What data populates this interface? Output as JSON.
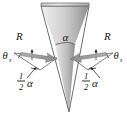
{
  "figure": {
    "background_color": "#ffffff",
    "width": 127,
    "height": 118
  },
  "cone": {
    "name": "cone-wedge",
    "fill_light": "#f2f2f2",
    "fill_mid": "#cfcfcf",
    "fill_dark": "#9b9b9b",
    "outline_color": "#6e6e6e",
    "apex_x": 69,
    "apex_y": 112,
    "top_left_x": 41,
    "top_right_x": 89,
    "top_y": 5
  },
  "labels": {
    "apex_angle": "α",
    "half_angle_numerator": "1",
    "half_angle_denominator": "2",
    "half_angle_symbol": "α",
    "ray_left": "R",
    "ray_right": "R",
    "incidence_left": "θ",
    "incidence_left_sub": "s",
    "incidence_right": "θ",
    "incidence_right_sub": "s"
  },
  "arrows": {
    "left": {
      "name": "incident-ray-left",
      "color": "#9a9a9a",
      "edge_color": "#7a7a7a",
      "direction": "points down-right toward cone surface"
    },
    "right": {
      "name": "incident-ray-right",
      "color": "#9a9a9a",
      "edge_color": "#7a7a7a",
      "direction": "points down-left toward cone surface"
    }
  },
  "guides": {
    "line_color": "#4a4a4a",
    "arc_color": "#3a3a3a"
  }
}
